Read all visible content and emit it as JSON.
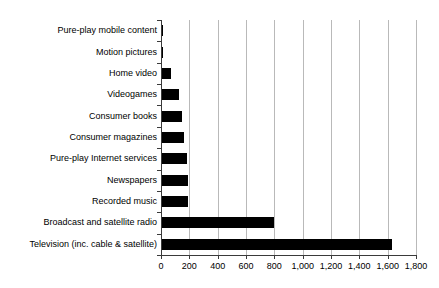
{
  "chart_data": {
    "type": "bar",
    "orientation": "horizontal",
    "title": "",
    "subtitle": "",
    "xlabel": "",
    "ylabel": "",
    "xlim": [
      0,
      1800
    ],
    "xticks": [
      0,
      200,
      400,
      600,
      800,
      1000,
      1200,
      1400,
      1600,
      1800
    ],
    "xtick_labels": [
      "0",
      "200",
      "400",
      "600",
      "800",
      "1,000",
      "1,200",
      "1,400",
      "1,600",
      "1,800"
    ],
    "grid": "vertical",
    "legend": "none",
    "bar_color": "#000000",
    "categories": [
      "Pure-play mobile content",
      "Motion pictures",
      "Home video",
      "Videogames",
      "Consumer books",
      "Consumer magazines",
      "Pure-play Internet services",
      "Newspapers",
      "Recorded music",
      "Broadcast and satellite radio",
      "Television (inc. cable & satellite)"
    ],
    "values": [
      15,
      15,
      70,
      125,
      145,
      165,
      185,
      190,
      190,
      800,
      1630
    ]
  }
}
